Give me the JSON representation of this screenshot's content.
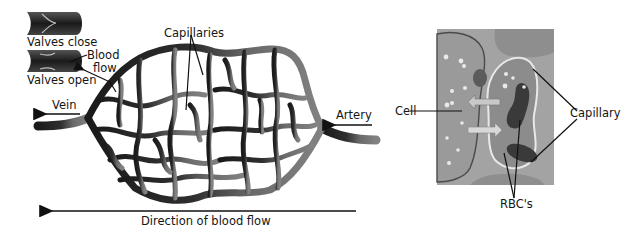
{
  "left_diagram": {
    "labels": {
      "valves_close": "Valves close",
      "valves_open": "Valves open",
      "blood_flow_line1": "Blood",
      "blood_flow_line2": "flow",
      "capillaries": "Capillaries",
      "vein": "Vein",
      "artery": "Artery",
      "direction": "Direction of blood flow"
    },
    "colors": {
      "vein_side": "#1e1e1e",
      "artery_side": "#7a7a7a"
    }
  },
  "right_diagram": {
    "labels": {
      "cell": "Cell",
      "capillary": "Capillary",
      "rbcs": "RBC's"
    },
    "colors": {
      "tissue_bg": "#a3a3a3",
      "cell_body": "#9a9a9a",
      "capillary_interior": "#8c8c8c",
      "rbc": "#3a3a3a"
    }
  }
}
